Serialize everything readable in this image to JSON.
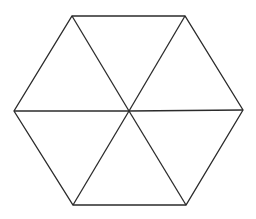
{
  "diagram": {
    "shape": "regular hexagon divided into six equilateral triangles",
    "background": "#ffffff",
    "stroke_color": "#2b2b2b",
    "stroke_width": 1.3,
    "center": [
      129,
      111
    ],
    "vertices": [
      [
        72,
        16
      ],
      [
        185,
        16
      ],
      [
        243,
        110
      ],
      [
        186,
        205
      ],
      [
        73,
        205
      ],
      [
        14,
        111
      ]
    ],
    "triangles": 6
  }
}
